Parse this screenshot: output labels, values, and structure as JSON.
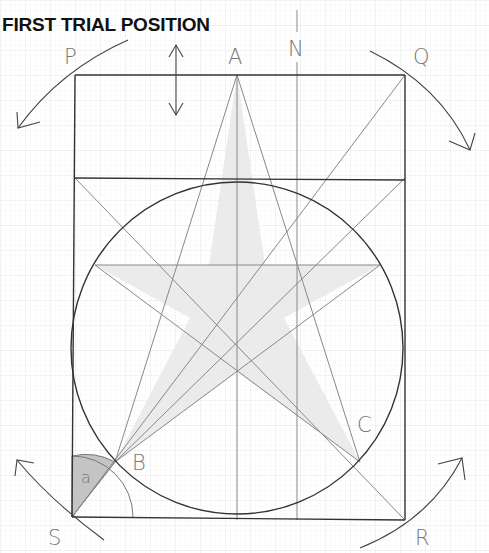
{
  "title": "FIRST TRIAL POSITION",
  "points": {
    "P": "P",
    "Q": "Q",
    "R": "R",
    "S": "S",
    "A": "A",
    "N": "N",
    "B": "B",
    "C": "C"
  },
  "angle_label": "a",
  "colors": {
    "grid": "#e6e6e6",
    "frame": "#333333",
    "construction": "#888888",
    "star_fill": "#ececec",
    "angle_fill": "#c8c8c8",
    "label": "#777777"
  }
}
